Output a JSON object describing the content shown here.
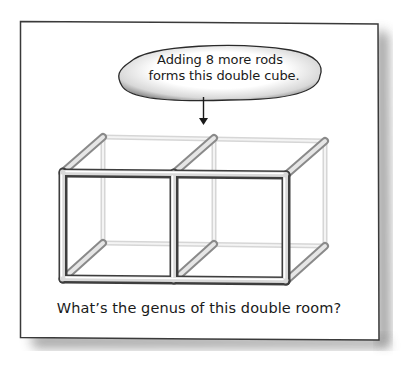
{
  "bubble": {
    "line1": "Adding 8 more rods",
    "line2": "forms this double cube."
  },
  "caption": "What’s the genus of this double room?",
  "figure": {
    "cells": 2,
    "front_rods_color": "#4a4a4a",
    "back_rods_color": "#d0d0d0",
    "depth_rods_color": "#9a9a9a"
  },
  "frame": {
    "border_color": "#3a3a3a",
    "shadow_color": "#555555",
    "background": "#ffffff"
  }
}
